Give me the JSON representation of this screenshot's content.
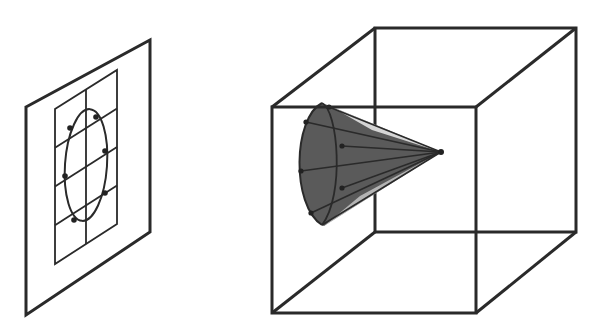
{
  "figure": {
    "colors": {
      "background": "#ffffff",
      "stroke": "#2a2a2a",
      "cone_fill": "#5a5a5a",
      "point": "#222222"
    },
    "left_panel": {
      "label": "image-plane",
      "plane": [
        [
          26,
          107
        ],
        [
          150,
          40
        ],
        [
          150,
          232
        ],
        [
          26,
          315
        ]
      ],
      "grid": {
        "corners": [
          [
            55,
            109
          ],
          [
            117,
            70
          ],
          [
            117,
            224
          ],
          [
            55,
            264
          ]
        ],
        "columns": 2,
        "rows": 4
      },
      "ellipse": {
        "cx": 86,
        "cy": 165,
        "rx": 21,
        "ry": 56
      },
      "points": [
        [
          70,
          128
        ],
        [
          96,
          117
        ],
        [
          105,
          151
        ],
        [
          65,
          176
        ],
        [
          105,
          193
        ],
        [
          74,
          220
        ]
      ]
    },
    "right_panel": {
      "label": "cube-with-cone",
      "cube": {
        "front": [
          [
            272,
            107
          ],
          [
            476,
            107
          ],
          [
            476,
            313
          ],
          [
            272,
            313
          ]
        ],
        "back": [
          [
            375,
            28
          ],
          [
            576,
            28
          ],
          [
            576,
            232
          ],
          [
            375,
            232
          ]
        ]
      },
      "cone": {
        "apex": [
          441,
          152
        ],
        "base_outline_front": "M 322,103 C 293,118 291,205 322,225",
        "base_outline_back": "M 322,103 C 338,110 345,195 322,225",
        "base_points": [
          [
            306,
            122
          ],
          [
            301,
            171
          ],
          [
            311,
            213
          ],
          [
            342,
            146
          ],
          [
            342,
            188
          ],
          [
            329,
            107
          ]
        ]
      }
    }
  }
}
